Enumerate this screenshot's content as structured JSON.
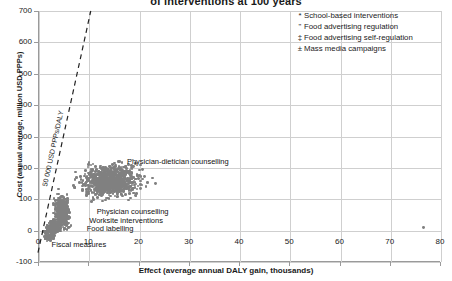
{
  "chart_data": {
    "type": "scatter",
    "title": "of interventions at 100 years",
    "xlabel": "Effect (average annual DALY gain, thousands)",
    "ylabel": "Cost (annual average, million USD PPPs)",
    "xlim": [
      0,
      80
    ],
    "ylim": [
      -100,
      700
    ],
    "xticks": [
      0,
      10,
      20,
      30,
      40,
      50,
      60,
      70,
      80
    ],
    "yticks": [
      -100,
      0,
      100,
      200,
      300,
      400,
      500,
      600,
      700
    ],
    "grid": true,
    "legend_position": "top-right",
    "marker_color": "#808080",
    "reference_line": {
      "label": "50 000 USD PPPs/DALY",
      "style": "dashed",
      "slope_per_1000_daly": 50,
      "x_at_top": 10.5,
      "y_at_top": 700
    },
    "legend": [
      {
        "symbol": "*",
        "label": "School-based interventions"
      },
      {
        "symbol": "\"",
        "label": "Food advertising regulation"
      },
      {
        "symbol": "‡",
        "label": "Food advertising self-regulation"
      },
      {
        "symbol": "±",
        "label": "Mass media campaigns"
      }
    ],
    "annotations": [
      {
        "text": "Physician-dietician counselling",
        "x": 17.5,
        "y": 218
      },
      {
        "text": "Physician counselling",
        "x": 11.5,
        "y": 58
      },
      {
        "text": "Worksite interventions",
        "x": 10.0,
        "y": 30
      },
      {
        "text": "Food labelling",
        "x": 9.5,
        "y": 5
      },
      {
        "text": "Fiscal measures",
        "x": 2.5,
        "y": -45
      }
    ],
    "clusters": [
      {
        "name": "Physician-dietician counselling",
        "cx": 14.0,
        "cy": 158,
        "rx": 5.4,
        "ry": 52,
        "n": 900,
        "color": "#808080"
      },
      {
        "name": "Physician counselling",
        "cx": 4.6,
        "cy": 58,
        "rx": 1.5,
        "ry": 55,
        "n": 420,
        "color": "#808080"
      },
      {
        "name": "Worksite interventions",
        "cx": 3.0,
        "cy": 12,
        "rx": 1.0,
        "ry": 22,
        "n": 160,
        "color": "#808080"
      },
      {
        "name": "Food labelling",
        "cx": 2.2,
        "cy": 2,
        "rx": 0.9,
        "ry": 14,
        "n": 120,
        "color": "#808080"
      },
      {
        "name": "Fiscal measures",
        "cx": 2.0,
        "cy": -22,
        "rx": 1.0,
        "ry": 9,
        "n": 90,
        "color": "#808080"
      }
    ],
    "outliers": [
      {
        "x": 19.6,
        "y": 175
      },
      {
        "x": 21.0,
        "y": 172
      },
      {
        "x": 22.6,
        "y": 168
      },
      {
        "x": 21.3,
        "y": 140
      },
      {
        "x": 20.2,
        "y": 134
      },
      {
        "x": 23.2,
        "y": 150
      },
      {
        "x": 19.2,
        "y": 112
      },
      {
        "x": 20.6,
        "y": 196
      },
      {
        "x": 18.8,
        "y": 205
      },
      {
        "x": 76.5,
        "y": 10
      }
    ]
  }
}
